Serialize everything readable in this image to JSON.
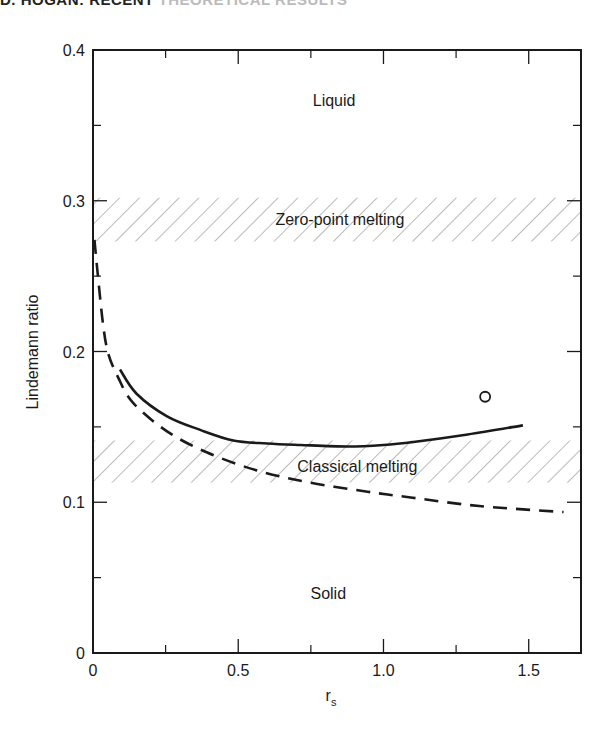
{
  "page": {
    "running_head_bold": "D. HOGAN: RECENT",
    "running_head_light": "THEORETICAL RESULTS"
  },
  "chart_data": {
    "type": "line",
    "title": "",
    "xlabel": "r_s",
    "xlabel_main": "r",
    "xlabel_sub": "s",
    "ylabel": "Lindemann ratio",
    "xlim": [
      0,
      1.68
    ],
    "ylim": [
      0,
      0.4
    ],
    "x_ticks": [
      0,
      0.5,
      1.0,
      1.5
    ],
    "x_tick_labels": [
      "0",
      "0.5",
      "1.0",
      "1.5"
    ],
    "x_minor_ticks": [
      0.25,
      0.75,
      1.25
    ],
    "y_ticks": [
      0,
      0.1,
      0.2,
      0.3,
      0.4
    ],
    "y_tick_labels": [
      "0",
      "0.1",
      "0.2",
      "0.3",
      "0.4"
    ],
    "y_minor_ticks": [
      0.05,
      0.15,
      0.25,
      0.35
    ],
    "grid": false,
    "legend": null,
    "bands": [
      {
        "name": "Zero-point melting",
        "y_min": 0.273,
        "y_max": 0.302,
        "style": "hatched"
      },
      {
        "name": "Classical melting",
        "y_min": 0.113,
        "y_max": 0.141,
        "style": "hatched"
      }
    ],
    "region_labels": [
      {
        "text": "Liquid",
        "x": 0.83,
        "y": 0.367
      },
      {
        "text": "Zero-point melting",
        "x": 0.85,
        "y": 0.288
      },
      {
        "text": "Classical melting",
        "x": 0.91,
        "y": 0.124
      },
      {
        "text": "Solid",
        "x": 0.81,
        "y": 0.04
      }
    ],
    "series": [
      {
        "name": "solid curve",
        "style": "solid",
        "x": [
          0.093,
          0.15,
          0.255,
          0.369,
          0.483,
          0.6,
          0.714,
          0.876,
          1.0,
          1.103,
          1.29,
          1.48
        ],
        "y": [
          0.188,
          0.172,
          0.157,
          0.148,
          0.141,
          0.139,
          0.138,
          0.137,
          0.138,
          0.14,
          0.145,
          0.151
        ]
      },
      {
        "name": "dashed curve",
        "style": "dashed",
        "x": [
          0.005,
          0.016,
          0.034,
          0.052,
          0.086,
          0.138,
          0.255,
          0.393,
          0.566,
          0.748,
          0.945,
          1.1,
          1.33,
          1.62
        ],
        "y": [
          0.274,
          0.252,
          0.219,
          0.199,
          0.183,
          0.166,
          0.147,
          0.133,
          0.121,
          0.113,
          0.107,
          0.103,
          0.0975,
          0.0935
        ]
      },
      {
        "name": "data point",
        "style": "open-circle",
        "x": [
          1.35
        ],
        "y": [
          0.17
        ]
      }
    ]
  }
}
